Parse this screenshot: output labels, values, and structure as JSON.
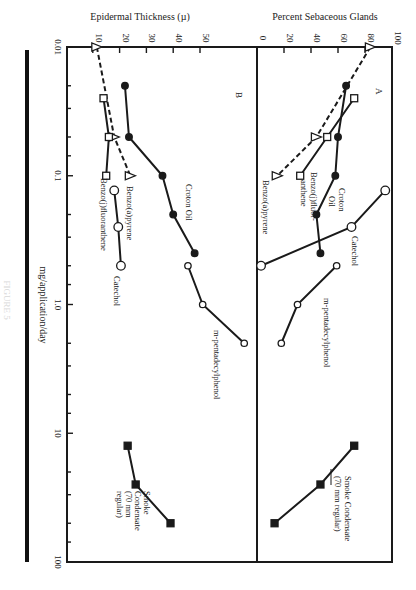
{
  "chart_data": [
    {
      "panel": "A",
      "type": "line",
      "title": "",
      "panel_label": "A",
      "xlabel": "mg/application/day",
      "ylabel": "Percent Sebaceous Glands",
      "xscale": "log",
      "xlim": [
        0.01,
        100
      ],
      "ylim": [
        0,
        100
      ],
      "x_ticks": [
        "0.01",
        "0.1",
        "1.0",
        "10",
        "100"
      ],
      "y_ticks": [
        "0",
        "20",
        "40",
        "60",
        "80",
        "100"
      ],
      "grid": false,
      "orientation": "rotated 90deg clockwise (dose axis vertical, values increase rightward)",
      "series": [
        {
          "name": "Benzo(a)pyrene",
          "marker": "open-triangle",
          "line": "dashed",
          "points": [
            [
              0.01,
              84
            ],
            [
              0.05,
              44
            ],
            [
              0.1,
              15
            ]
          ]
        },
        {
          "name": "Benzo(j)fluoranthene",
          "marker": "open-square",
          "line": "solid",
          "points": [
            [
              0.025,
              72
            ],
            [
              0.05,
              52
            ],
            [
              0.1,
              32
            ]
          ]
        },
        {
          "name": "Croton Oil",
          "marker": "filled-circle",
          "line": "solid",
          "points": [
            [
              0.02,
              66
            ],
            [
              0.05,
              60
            ],
            [
              0.1,
              58
            ],
            [
              0.2,
              44
            ],
            [
              0.4,
              47
            ]
          ]
        },
        {
          "name": "Catechol",
          "marker": "open-circle",
          "line": "solid",
          "points": [
            [
              0.13,
              95
            ],
            [
              0.25,
              70
            ],
            [
              0.5,
              3
            ]
          ]
        },
        {
          "name": "m-pentadecylphenol",
          "marker": "open-circle-small",
          "line": "solid",
          "points": [
            [
              0.5,
              59
            ],
            [
              1.0,
              30
            ],
            [
              2.0,
              18
            ]
          ]
        },
        {
          "name": "Smoke Condensate (70 mm regular)",
          "marker": "filled-square",
          "line": "solid",
          "points": [
            [
              12.5,
              72
            ],
            [
              25,
              47
            ],
            [
              50,
              13
            ]
          ]
        }
      ]
    },
    {
      "panel": "B",
      "type": "line",
      "title": "",
      "panel_label": "B",
      "xlabel": "mg/application/day",
      "ylabel": "Epidermal Thickness (µ)",
      "xscale": "log",
      "xlim": [
        0.01,
        100
      ],
      "ylim": [
        0,
        70
      ],
      "x_ticks": [
        "0.01",
        "0.1",
        "1.0",
        "10",
        "100"
      ],
      "y_ticks": [
        "10",
        "20",
        "30",
        "40",
        "50"
      ],
      "grid": false,
      "orientation": "rotated 90deg clockwise (dose axis vertical, values increase rightward)",
      "series": [
        {
          "name": "Benzo(a)pyrene",
          "marker": "open-triangle",
          "line": "dashed",
          "points": [
            [
              0.01,
              11.5
            ],
            [
              0.05,
              18
            ],
            [
              0.1,
              24
            ]
          ]
        },
        {
          "name": "Benzo(j)fluoranthene",
          "marker": "open-square",
          "line": "solid",
          "points": [
            [
              0.025,
              14
            ],
            [
              0.05,
              16
            ],
            [
              0.1,
              15
            ]
          ]
        },
        {
          "name": "Croton Oil",
          "marker": "filled-circle",
          "line": "solid",
          "points": [
            [
              0.02,
              22
            ],
            [
              0.05,
              23.5
            ],
            [
              0.1,
              36
            ],
            [
              0.2,
              40
            ],
            [
              0.4,
              48
            ]
          ]
        },
        {
          "name": "Catechol",
          "marker": "open-circle",
          "line": "solid",
          "points": [
            [
              0.13,
              18
            ],
            [
              0.25,
              19.5
            ],
            [
              0.5,
              20.5
            ]
          ]
        },
        {
          "name": "m-pentadecylphenol",
          "marker": "open-circle-small",
          "line": "solid",
          "points": [
            [
              0.5,
              45.5
            ],
            [
              1.0,
              51
            ],
            [
              2.0,
              66.5
            ]
          ]
        },
        {
          "name": "Smoke Condensate (70 mm regular)",
          "marker": "filled-square",
          "line": "solid",
          "points": [
            [
              12.5,
              23
            ],
            [
              25,
              26
            ],
            [
              50,
              39
            ]
          ]
        }
      ]
    }
  ],
  "labels": {
    "panel_a_title": "Percent  Sebaceous Glands",
    "panel_b_title": "Epidermal Thickness (µ)",
    "x_axis_title": "mg/application/day",
    "panel_a_letter": "A",
    "panel_b_letter": "B",
    "figure_caption": "FIGURE 5"
  },
  "series_labels": {
    "A": {
      "benzo_a_pyrene": "Benzo(a)pyrene",
      "benzo_j_fluor_1": "Benzo(j)fluor-",
      "benzo_j_fluor_2": "anthene",
      "croton_1": "Croton",
      "croton_2": "Oil",
      "catechol": "Catechol",
      "mpdp": "m-pentadecylphenol",
      "smoke_1": "Smoke Condensate",
      "smoke_2": "(70 mm regular)"
    },
    "B": {
      "benzo_a_pyrene": "Benzo(a)pyrene",
      "benzo_j_fluor": "Benzo(j)fluoranthene",
      "croton": "Croton Oil",
      "catechol": "Catechol",
      "mpdp": "m-pentadecylphenol",
      "smoke_1": "Smoke",
      "smoke_2": "Condensate",
      "smoke_3": "(70 mm",
      "smoke_4": "regular)"
    }
  },
  "colors": {
    "ink": "#1a1a1a",
    "paper": "#ffffff"
  }
}
